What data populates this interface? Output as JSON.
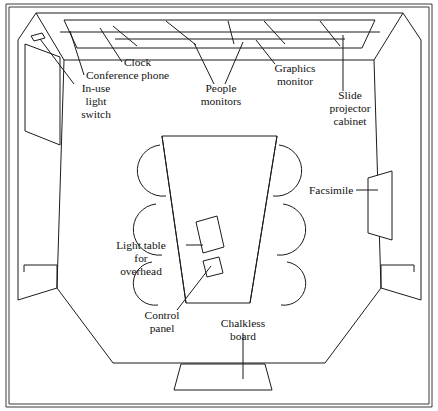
{
  "figure": {
    "title": "Conference room perspective cutaway",
    "stroke_color": "#1b1b1b",
    "background_color": "#ffffff",
    "frame_color": "#3a3a3a"
  },
  "labels": [
    {
      "id": "clock",
      "name": "clock",
      "lines": [
        "Clock"
      ],
      "x": 124,
      "y": 66,
      "anchor": "start"
    },
    {
      "id": "conference-phone",
      "name": "conference-phone",
      "lines": [
        "Conference phone"
      ],
      "x": 86,
      "y": 79,
      "anchor": "start"
    },
    {
      "id": "in-use-light-switch",
      "name": "in-use-light-switch",
      "lines": [
        "In-use",
        "light",
        "switch"
      ],
      "x": 96,
      "y": 92,
      "anchor": "middle"
    },
    {
      "id": "people-monitors",
      "name": "people-monitors",
      "lines": [
        "People",
        "monitors"
      ],
      "x": 221,
      "y": 92,
      "anchor": "middle"
    },
    {
      "id": "graphics-monitor",
      "name": "graphics-monitor",
      "lines": [
        "Graphics",
        "monitor"
      ],
      "x": 295,
      "y": 72,
      "anchor": "middle"
    },
    {
      "id": "slide-projector-cabinet",
      "name": "slide-projector-cabinet",
      "lines": [
        "Slide",
        "projector",
        "cabinet"
      ],
      "x": 350,
      "y": 99,
      "anchor": "middle"
    },
    {
      "id": "facsimile",
      "name": "facsimile",
      "lines": [
        "Facsimile"
      ],
      "x": 309,
      "y": 194,
      "anchor": "start"
    },
    {
      "id": "light-table-for-overhead",
      "name": "light-table-for-overhead",
      "lines": [
        "Light table",
        "for",
        "overhead"
      ],
      "x": 141,
      "y": 249,
      "anchor": "middle"
    },
    {
      "id": "control-panel",
      "name": "control-panel",
      "lines": [
        "Control",
        "panel"
      ],
      "x": 162,
      "y": 319,
      "anchor": "middle"
    },
    {
      "id": "chalkless-board",
      "name": "chalkless-board",
      "lines": [
        "Chalkless",
        "board"
      ],
      "x": 243,
      "y": 327,
      "anchor": "middle"
    }
  ],
  "geometry": {
    "outer_frame": "M 6 4 L 432 4 L 432 407 L 6 407 Z",
    "inner_frame": "M 9 7 L 429 7 L 429 404 L 9 404 Z",
    "room_outline": "M 24 272 L 24 265 L 57 265 L 57 288 M 414 272 L 414 265 L 381 265 L 381 288",
    "wall_back_top": "M 36 13 L 403 13",
    "ceiling_left_edge": "M 36 13 L 64 60",
    "ceiling_right_edge": "M 403 13 L 374 60",
    "ceiling_band_bottom": "M 64 60 L 374 60",
    "ceiling_panel_outer": "M 64 20 L 375 20 L 362 48 L 77 48 Z",
    "ceiling_rails": [
      "M 60 32 L 380 32",
      "M 115 39 L 345 39",
      "M 113 26 L 137 46",
      "M 166 21 L 196 45",
      "M 228 21 L 234 44",
      "M 264 21 L 285 44",
      "M 320 21 L 340 46"
    ],
    "left_wall_outer": "M 36 13 L 18 40 L 18 300 L 57 288",
    "left_wall_inner": "M 64 60 L 57 288",
    "left_wall_front": "M 18 40 L 36 13",
    "left_wall_panel": "M 25 44 L 60 57 L 60 145 L 25 131 Z",
    "left_wall_switch": "M 31 36 L 42 33 L 45 38 L 34 41 Z",
    "right_wall_outer": "M 403 13 L 421 40 L 421 300 L 381 288",
    "right_wall_inner": "M 374 60 L 381 288",
    "right_wall_panel": "M 368 178 L 392 171 L 392 240 L 368 233 Z",
    "floor_left": "M 57 288 L 113 363",
    "floor_right": "M 381 288 L 325 363",
    "floor_front": "M 113 363 L 325 363",
    "table": "M 162 136 L 277 136 L 250 303 L 186 303 Z",
    "table_inner_left": "M 162 136 L 186 303",
    "table_inner_right": "M 277 136 L 250 303",
    "chairs_left": [
      "M 160 145 A 17 17 0 1 0 166 196",
      "M 156 204 A 17 17 0 1 0 162 255",
      "M 152 262 A 17 17 0 1 0 158 305"
    ],
    "chairs_right": [
      "M 279 145 A 17 17 0 1 1 273 196",
      "M 283 204 A 17 17 0 1 1 277 255",
      "M 287 262 A 17 17 0 1 1 281 305"
    ],
    "light_table": "M 196 222 L 217 216 L 224 247 L 203 253 Z",
    "control_panel": "M 203 261 L 219 257 L 223 273 L 207 277 Z",
    "chalkless_board": "M 181 364 L 265 364 L 272 390 L 174 390 Z"
  },
  "leaders": [
    {
      "id": "leader-clock",
      "name": "leader-clock",
      "path": "M 122 62 L 100 28"
    },
    {
      "id": "leader-conference-phone",
      "name": "leader-conference-phone",
      "path": "M 84 75 L 70 31"
    },
    {
      "id": "leader-in-use-light-switch",
      "name": "leader-in-use-light-switch",
      "path": "M 74 84 L 40 39"
    },
    {
      "id": "leader-people-monitors-left",
      "name": "leader-people-monitors-left",
      "path": "M 214 84 L 194 43"
    },
    {
      "id": "leader-people-monitors-right",
      "name": "leader-people-monitors-right",
      "path": "M 225 84 L 243 42"
    },
    {
      "id": "leader-graphics-monitor",
      "name": "leader-graphics-monitor",
      "path": "M 275 64 L 256 40"
    },
    {
      "id": "leader-slide-projector-cabinet",
      "name": "leader-slide-projector-cabinet",
      "path": "M 343 91 L 343 35"
    },
    {
      "id": "leader-facsimile",
      "name": "leader-facsimile",
      "path": "M 356 190 L 378 190"
    },
    {
      "id": "leader-light-table",
      "name": "leader-light-table",
      "path": "M 186 245 L 203 245"
    },
    {
      "id": "leader-control-panel",
      "name": "leader-control-panel",
      "path": "M 177 310 L 211 266"
    },
    {
      "id": "leader-chalkless-board",
      "name": "leader-chalkless-board",
      "path": "M 243 333 L 243 379"
    }
  ]
}
